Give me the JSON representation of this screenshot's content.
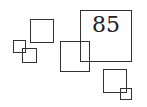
{
  "diagram": {
    "stroke_color": "#333333",
    "background": "#ffffff",
    "label": {
      "text": "85",
      "font_size": 22
    },
    "squares": [
      {
        "id": "big-labeled",
        "x": 80,
        "y": 10,
        "w": 52,
        "h": 52
      },
      {
        "id": "upper-left",
        "x": 30,
        "y": 19,
        "w": 24,
        "h": 24
      },
      {
        "id": "small-left",
        "x": 13,
        "y": 40,
        "w": 13,
        "h": 13
      },
      {
        "id": "small-left-lower",
        "x": 22,
        "y": 48,
        "w": 15,
        "h": 15
      },
      {
        "id": "center",
        "x": 60,
        "y": 41,
        "w": 30,
        "h": 31
      },
      {
        "id": "lower-right",
        "x": 103,
        "y": 69,
        "w": 24,
        "h": 24
      },
      {
        "id": "small-lower-right",
        "x": 120,
        "y": 88,
        "w": 12,
        "h": 12
      }
    ]
  }
}
